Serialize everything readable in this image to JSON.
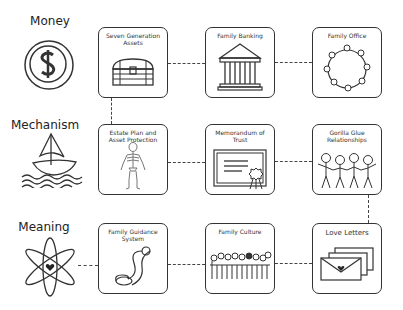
{
  "rows": [
    {
      "label": "Money",
      "icon": "coin-dollar-icon"
    },
    {
      "label": "Mechanism",
      "icon": "sailboat-icon"
    },
    {
      "label": "Meaning",
      "icon": "atom-heart-icon"
    }
  ],
  "boxes": {
    "r1c1": {
      "title": "Seven Generation Assets",
      "icon": "treasure-chest-icon"
    },
    "r1c2": {
      "title": "Family Banking",
      "icon": "bank-building-icon"
    },
    "r1c3": {
      "title": "Family Office",
      "icon": "round-table-icon"
    },
    "r2c1": {
      "title": "Estate Plan and Asset Protection",
      "icon": "skeleton-icon"
    },
    "r2c2": {
      "title": "Memorandum of Trust",
      "icon": "certificate-icon"
    },
    "r2c3": {
      "title": "Gorilla Glue Relationships",
      "icon": "stick-figures-icon"
    },
    "r3c1": {
      "title": "Family Guidance System",
      "icon": "scroll-icon"
    },
    "r3c2": {
      "title": "Family Culture",
      "icon": "family-gathering-icon"
    },
    "r3c3": {
      "title": "Love Letters",
      "icon": "envelopes-icon"
    }
  },
  "colors": {
    "stroke": "#333333",
    "background": "#ffffff"
  }
}
